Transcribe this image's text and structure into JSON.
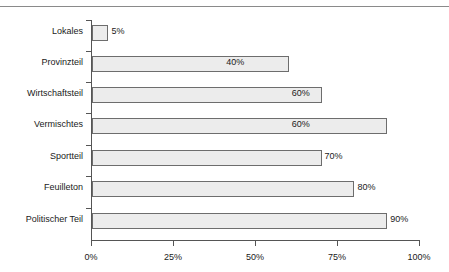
{
  "chart_data": {
    "type": "bar",
    "orientation": "horizontal",
    "title": "",
    "subtitle": "",
    "xlabel": "",
    "ylabel": "",
    "xlim": [
      0,
      100
    ],
    "grid": false,
    "legend": null,
    "xticks": [
      "0%",
      "25%",
      "50%",
      "75%",
      "100%"
    ],
    "xtick_values": [
      0,
      25,
      50,
      75,
      100
    ],
    "categories": [
      "Lokales",
      "Provinzteil",
      "Wirtschaftsteil",
      "Vermischtes",
      "Sportteil",
      "Feuilleton",
      "Politischer Teil"
    ],
    "values": [
      5,
      40,
      60,
      60,
      70,
      80,
      90
    ],
    "data_labels": [
      "5%",
      "40%",
      "60%",
      "60%",
      "70%",
      "80%",
      "90%"
    ],
    "bar_fill": "#ececec",
    "bar_border": "#6d6d6d",
    "axis_color": "#555555"
  }
}
